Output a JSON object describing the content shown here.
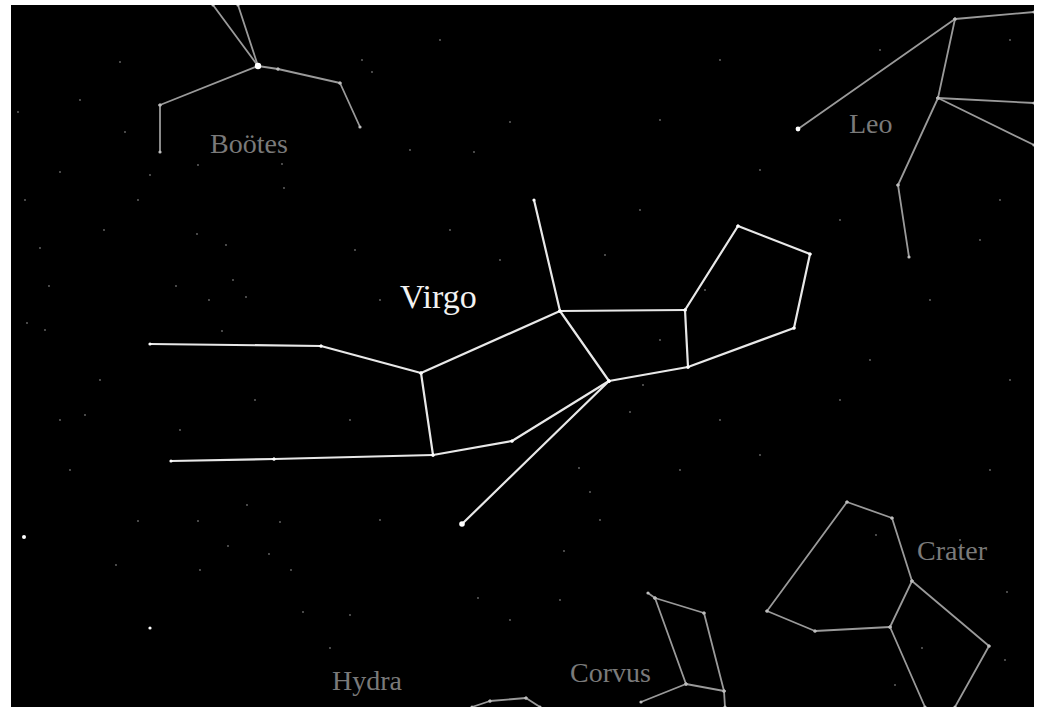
{
  "colors": {
    "background": "#000000",
    "frame": "#ffffff",
    "primary_line": "#e8e8e8",
    "secondary_line": "#9a9a9a",
    "primary_label": "#f2f2f2",
    "secondary_label": "#7a7a7a"
  },
  "labels": {
    "virgo": "Virgo",
    "bootes": "Boötes",
    "leo": "Leo",
    "crater": "Crater",
    "corvus": "Corvus",
    "hydra": "Hydra"
  },
  "constellations": [
    {
      "name": "Virgo",
      "highlight": true,
      "segments": [
        [
          [
            534,
            200
          ],
          [
            560,
            311
          ]
        ],
        [
          [
            560,
            311
          ],
          [
            421,
            373
          ]
        ],
        [
          [
            560,
            311
          ],
          [
            685,
            310
          ]
        ],
        [
          [
            560,
            311
          ],
          [
            609,
            381
          ]
        ],
        [
          [
            685,
            310
          ],
          [
            738,
            226
          ]
        ],
        [
          [
            738,
            226
          ],
          [
            810,
            254
          ]
        ],
        [
          [
            810,
            254
          ],
          [
            794,
            328
          ]
        ],
        [
          [
            794,
            328
          ],
          [
            688,
            367
          ]
        ],
        [
          [
            688,
            367
          ],
          [
            685,
            310
          ]
        ],
        [
          [
            688,
            367
          ],
          [
            609,
            381
          ]
        ],
        [
          [
            150,
            344
          ],
          [
            321,
            346
          ]
        ],
        [
          [
            321,
            346
          ],
          [
            421,
            373
          ]
        ],
        [
          [
            421,
            373
          ],
          [
            433,
            455
          ]
        ],
        [
          [
            171,
            461
          ],
          [
            274,
            459
          ]
        ],
        [
          [
            274,
            459
          ],
          [
            433,
            455
          ]
        ],
        [
          [
            433,
            455
          ],
          [
            512,
            441
          ]
        ],
        [
          [
            512,
            441
          ],
          [
            609,
            381
          ]
        ],
        [
          [
            609,
            381
          ],
          [
            462,
            524
          ]
        ]
      ]
    },
    {
      "name": "Boötes",
      "highlight": false,
      "segments": [
        [
          [
            258,
            66
          ],
          [
            213,
            5
          ]
        ],
        [
          [
            258,
            66
          ],
          [
            238,
            5
          ]
        ],
        [
          [
            258,
            66
          ],
          [
            160,
            105
          ]
        ],
        [
          [
            160,
            105
          ],
          [
            160,
            152
          ]
        ],
        [
          [
            258,
            66
          ],
          [
            278,
            69
          ]
        ],
        [
          [
            278,
            69
          ],
          [
            340,
            83
          ]
        ],
        [
          [
            340,
            83
          ],
          [
            360,
            127
          ]
        ]
      ]
    },
    {
      "name": "Leo",
      "highlight": false,
      "segments": [
        [
          [
            798,
            129
          ],
          [
            955,
            19
          ]
        ],
        [
          [
            955,
            19
          ],
          [
            1034,
            12
          ]
        ],
        [
          [
            955,
            19
          ],
          [
            938,
            98
          ]
        ],
        [
          [
            938,
            98
          ],
          [
            1034,
            103
          ]
        ],
        [
          [
            938,
            98
          ],
          [
            1034,
            145
          ]
        ],
        [
          [
            938,
            98
          ],
          [
            898,
            185
          ]
        ],
        [
          [
            898,
            185
          ],
          [
            909,
            257
          ]
        ]
      ]
    },
    {
      "name": "Crater",
      "highlight": false,
      "segments": [
        [
          [
            847,
            502
          ],
          [
            892,
            518
          ]
        ],
        [
          [
            892,
            518
          ],
          [
            912,
            581
          ]
        ],
        [
          [
            912,
            581
          ],
          [
            890,
            627
          ]
        ],
        [
          [
            890,
            627
          ],
          [
            815,
            631
          ]
        ],
        [
          [
            815,
            631
          ],
          [
            767,
            611
          ]
        ],
        [
          [
            767,
            611
          ],
          [
            847,
            502
          ]
        ],
        [
          [
            912,
            581
          ],
          [
            989,
            646
          ]
        ],
        [
          [
            989,
            646
          ],
          [
            955,
            707
          ]
        ],
        [
          [
            890,
            627
          ],
          [
            925,
            707
          ]
        ]
      ]
    },
    {
      "name": "Corvus",
      "highlight": false,
      "segments": [
        [
          [
            648,
            593
          ],
          [
            655,
            598
          ]
        ],
        [
          [
            655,
            598
          ],
          [
            704,
            613
          ]
        ],
        [
          [
            704,
            613
          ],
          [
            724,
            691
          ]
        ],
        [
          [
            724,
            691
          ],
          [
            725,
            707
          ]
        ],
        [
          [
            655,
            598
          ],
          [
            686,
            684
          ]
        ],
        [
          [
            686,
            684
          ],
          [
            724,
            691
          ]
        ],
        [
          [
            686,
            684
          ],
          [
            641,
            702
          ]
        ]
      ]
    },
    {
      "name": "Hydra",
      "highlight": false,
      "segments": [
        [
          [
            472,
            707
          ],
          [
            490,
            701
          ]
        ],
        [
          [
            490,
            701
          ],
          [
            526,
            698
          ]
        ],
        [
          [
            526,
            698
          ],
          [
            540,
            707
          ]
        ]
      ]
    }
  ],
  "bright_stars": [
    {
      "x": 258,
      "y": 66,
      "r": 3.2
    },
    {
      "x": 462,
      "y": 524,
      "r": 2.8
    },
    {
      "x": 798,
      "y": 129,
      "r": 2.4
    },
    {
      "x": 24,
      "y": 537,
      "r": 2.0
    },
    {
      "x": 150,
      "y": 628,
      "r": 1.6
    }
  ],
  "faint_stars": [
    [
      120,
      62
    ],
    [
      362,
      60
    ],
    [
      60,
      172
    ],
    [
      25,
      200
    ],
    [
      125,
      132
    ],
    [
      198,
      165
    ],
    [
      282,
      164
    ],
    [
      138,
      200
    ],
    [
      284,
      188
    ],
    [
      197,
      234
    ],
    [
      226,
      245
    ],
    [
      233,
      280
    ],
    [
      246,
      297
    ],
    [
      209,
      300
    ],
    [
      176,
      286
    ],
    [
      222,
      331
    ],
    [
      104,
      230
    ],
    [
      40,
      248
    ],
    [
      49,
      286
    ],
    [
      27,
      323
    ],
    [
      45,
      330
    ],
    [
      150,
      175
    ],
    [
      18,
      112
    ],
    [
      80,
      100
    ],
    [
      372,
      72
    ],
    [
      440,
      40
    ],
    [
      474,
      152
    ],
    [
      510,
      122
    ],
    [
      355,
      250
    ],
    [
      640,
      210
    ],
    [
      605,
      255
    ],
    [
      705,
      290
    ],
    [
      660,
      340
    ],
    [
      630,
      412
    ],
    [
      579,
      468
    ],
    [
      643,
      385
    ],
    [
      590,
      492
    ],
    [
      564,
      551
    ],
    [
      478,
      598
    ],
    [
      510,
      620
    ],
    [
      350,
      615
    ],
    [
      330,
      648
    ],
    [
      200,
      570
    ],
    [
      116,
      565
    ],
    [
      138,
      521
    ],
    [
      198,
      521
    ],
    [
      228,
      546
    ],
    [
      269,
      554
    ],
    [
      291,
      570
    ],
    [
      247,
      505
    ],
    [
      280,
      522
    ],
    [
      303,
      612
    ],
    [
      85,
      415
    ],
    [
      70,
      470
    ],
    [
      350,
      420
    ],
    [
      380,
      520
    ],
    [
      560,
      600
    ],
    [
      600,
      520
    ],
    [
      680,
      470
    ],
    [
      720,
      420
    ],
    [
      760,
      455
    ],
    [
      840,
      400
    ],
    [
      870,
      360
    ],
    [
      930,
      300
    ],
    [
      980,
      240
    ],
    [
      1010,
      380
    ],
    [
      990,
      470
    ],
    [
      960,
      540
    ],
    [
      1007,
      592
    ],
    [
      1005,
      660
    ],
    [
      876,
      535
    ],
    [
      922,
      648
    ],
    [
      895,
      685
    ],
    [
      1010,
      40
    ],
    [
      880,
      50
    ],
    [
      720,
      60
    ],
    [
      660,
      120
    ],
    [
      760,
      170
    ],
    [
      840,
      220
    ],
    [
      1000,
      200
    ],
    [
      410,
      150
    ],
    [
      450,
      230
    ],
    [
      380,
      300
    ],
    [
      500,
      260
    ],
    [
      255,
      400
    ],
    [
      180,
      430
    ],
    [
      100,
      380
    ],
    [
      60,
      420
    ]
  ]
}
